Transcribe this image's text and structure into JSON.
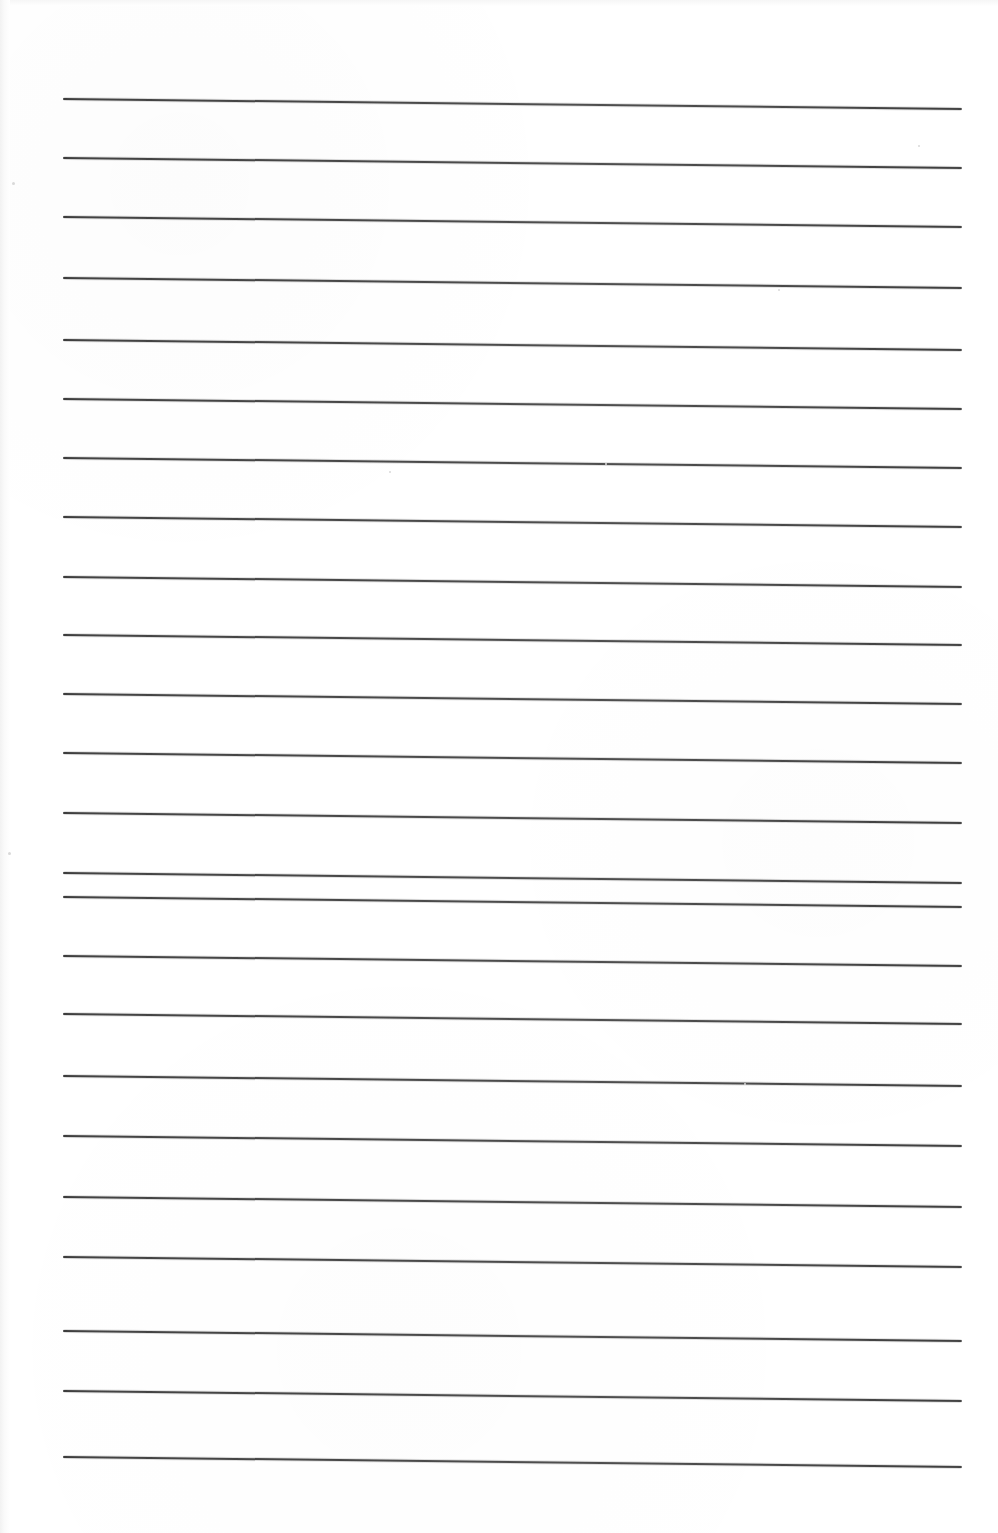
{
  "document": {
    "kind": "scanned-blank-ruled-paper",
    "title": "Blank Lined Notebook Page (Scan)",
    "page_width": 998,
    "page_height": 1533,
    "background_color": "#ffffff",
    "rule_color": "#3a3a3a",
    "text_content": "",
    "ruling": {
      "line_count": 24,
      "left_x": 63,
      "right_x": 962,
      "line_length": 899,
      "first_line_left_y": 98,
      "line_spacing": 59.1,
      "slope_drop_px": 10,
      "thickness_px": 2
    }
  },
  "lines": [
    {
      "index": 1,
      "left_y": 98
    },
    {
      "index": 2,
      "left_y": 157
    },
    {
      "index": 3,
      "left_y": 216
    },
    {
      "index": 4,
      "left_y": 277
    },
    {
      "index": 5,
      "left_y": 339
    },
    {
      "index": 6,
      "left_y": 398
    },
    {
      "index": 7,
      "left_y": 457
    },
    {
      "index": 8,
      "left_y": 516
    },
    {
      "index": 9,
      "left_y": 576
    },
    {
      "index": 10,
      "left_y": 634
    },
    {
      "index": 11,
      "left_y": 693
    },
    {
      "index": 12,
      "left_y": 752
    },
    {
      "index": 13,
      "left_y": 812
    },
    {
      "index": 14,
      "left_y": 872
    },
    {
      "index": 15,
      "left_y": 896
    },
    {
      "index": 16,
      "left_y": 955
    },
    {
      "index": 17,
      "left_y": 1013
    },
    {
      "index": 18,
      "left_y": 1075
    },
    {
      "index": 19,
      "left_y": 1135
    },
    {
      "index": 20,
      "left_y": 1196
    },
    {
      "index": 21,
      "left_y": 1256
    },
    {
      "index": 22,
      "left_y": 1330
    },
    {
      "index": 23,
      "left_y": 1390
    },
    {
      "index": 24,
      "left_y": 1456
    }
  ],
  "specks": [
    {
      "x": 778,
      "y": 289,
      "size": 2
    },
    {
      "x": 389,
      "y": 471,
      "size": 2
    },
    {
      "x": 605,
      "y": 463,
      "size": 2
    },
    {
      "x": 918,
      "y": 145,
      "size": 2
    },
    {
      "x": 12,
      "y": 182,
      "size": 3
    },
    {
      "x": 8,
      "y": 852,
      "size": 3
    },
    {
      "x": 744,
      "y": 1083,
      "size": 2
    }
  ]
}
